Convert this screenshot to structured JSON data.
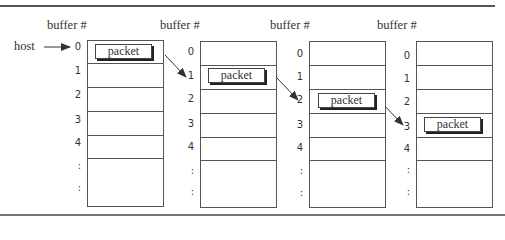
{
  "diagram": {
    "host_label": "host",
    "column_header": "buffer #",
    "packet_label": "packet",
    "row_labels": [
      "0",
      "1",
      "2",
      "3",
      "4",
      ":",
      ":"
    ],
    "columns": [
      {
        "header": "buffer #",
        "packet_row": 0
      },
      {
        "header": "buffer #",
        "packet_row": 1
      },
      {
        "header": "buffer #",
        "packet_row": 2
      },
      {
        "header": "buffer #",
        "packet_row": 3
      }
    ]
  }
}
